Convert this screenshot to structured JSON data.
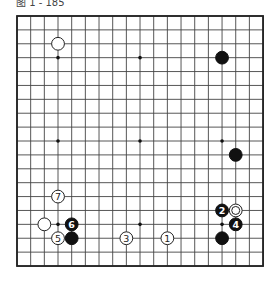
{
  "title": "图 1 - 185",
  "board": {
    "size": 19,
    "origin_x": 17,
    "origin_y": 16,
    "spacing_x": 13.67,
    "spacing_y": 13.89,
    "line_color": "#444444",
    "border_color": "#222222",
    "star_points": [
      [
        3,
        3
      ],
      [
        9,
        3
      ],
      [
        15,
        3
      ],
      [
        3,
        9
      ],
      [
        9,
        9
      ],
      [
        15,
        9
      ],
      [
        3,
        15
      ],
      [
        9,
        15
      ],
      [
        15,
        15
      ]
    ]
  },
  "stones": [
    {
      "color": "white",
      "col": 3,
      "row": 2,
      "label": ""
    },
    {
      "color": "black",
      "col": 15,
      "row": 3,
      "label": ""
    },
    {
      "color": "black",
      "col": 16,
      "row": 10,
      "label": ""
    },
    {
      "color": "white",
      "col": 3,
      "row": 13,
      "label": "7"
    },
    {
      "color": "black",
      "col": 15,
      "row": 14,
      "label": "2"
    },
    {
      "color": "white",
      "col": 16,
      "row": 14,
      "label": "",
      "marker": "double-circle"
    },
    {
      "color": "white",
      "col": 2,
      "row": 15,
      "label": ""
    },
    {
      "color": "black",
      "col": 4,
      "row": 15,
      "label": "6"
    },
    {
      "color": "black",
      "col": 16,
      "row": 15,
      "label": "4"
    },
    {
      "color": "white",
      "col": 3,
      "row": 16,
      "label": "5"
    },
    {
      "color": "black",
      "col": 4,
      "row": 16,
      "label": ""
    },
    {
      "color": "white",
      "col": 8,
      "row": 16,
      "label": "3"
    },
    {
      "color": "white",
      "col": 11,
      "row": 16,
      "label": "1"
    },
    {
      "color": "black",
      "col": 15,
      "row": 16,
      "label": ""
    }
  ]
}
